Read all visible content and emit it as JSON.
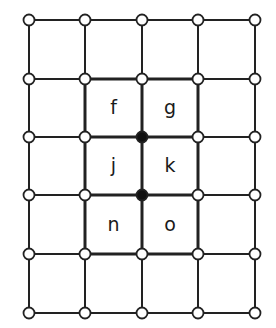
{
  "diagram": {
    "type": "grid-graph",
    "columns": [
      29,
      85,
      142,
      198,
      255
    ],
    "rows": [
      20,
      79,
      137,
      195,
      254,
      313
    ],
    "line_color": "#222222",
    "node_fill_open": "#ffffff",
    "node_fill_filled": "#111111",
    "highlight_region": {
      "col_start": 1,
      "col_end": 3,
      "row_start": 1,
      "row_end": 4
    },
    "filled_nodes": [
      [
        2,
        2
      ],
      [
        2,
        3
      ]
    ],
    "cells": [
      {
        "label": "f",
        "col": 1,
        "row": 1
      },
      {
        "label": "g",
        "col": 2,
        "row": 1
      },
      {
        "label": "j",
        "col": 1,
        "row": 2
      },
      {
        "label": "k",
        "col": 2,
        "row": 2
      },
      {
        "label": "n",
        "col": 1,
        "row": 3
      },
      {
        "label": "o",
        "col": 2,
        "row": 3
      }
    ]
  }
}
